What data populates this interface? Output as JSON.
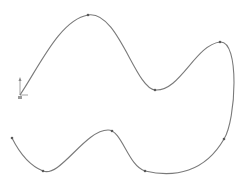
{
  "sketch": {
    "curve_color": "#7a7a7a",
    "point_color": "#5a5a5a",
    "axis_color": "#8a8a8a",
    "origin": {
      "x": 20,
      "y": 95
    },
    "spline_points": [
      {
        "x": 20,
        "y": 95
      },
      {
        "x": 88,
        "y": 15
      },
      {
        "x": 155,
        "y": 90
      },
      {
        "x": 220,
        "y": 42
      },
      {
        "x": 224,
        "y": 139
      },
      {
        "x": 145,
        "y": 171
      },
      {
        "x": 112,
        "y": 131
      },
      {
        "x": 43,
        "y": 171
      },
      {
        "x": 12,
        "y": 138
      }
    ],
    "path": "M20,95 C40,65 60,20 88,15 C118,10 135,88 155,90 C180,92 195,45 220,42 C240,40 236,120 224,139 C205,172 175,178 145,171 C128,166 122,130 108,130 C85,130 60,178 43,171 C28,165 18,150 12,138"
  }
}
